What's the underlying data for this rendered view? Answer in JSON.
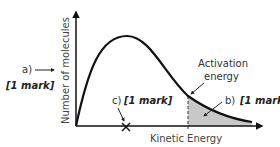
{
  "diagram": {
    "type": "Maxwell-Boltzmann distribution",
    "y_axis_label": "Number of molecules",
    "x_axis_label": "Kinetic Energy",
    "activation_energy_label_line1": "Activation",
    "activation_energy_label_line2": "energy",
    "label_a": "a)",
    "label_a_mark": "[1 mark]",
    "label_b": "b)",
    "label_b_mark": "[1 mark]",
    "label_c": "c)",
    "label_c_mark": "[1 mark]",
    "colors": {
      "curve": "#111111",
      "axis": "#111111",
      "shaded_area": "#c8c8c8",
      "dashed_line": "#555555"
    }
  }
}
